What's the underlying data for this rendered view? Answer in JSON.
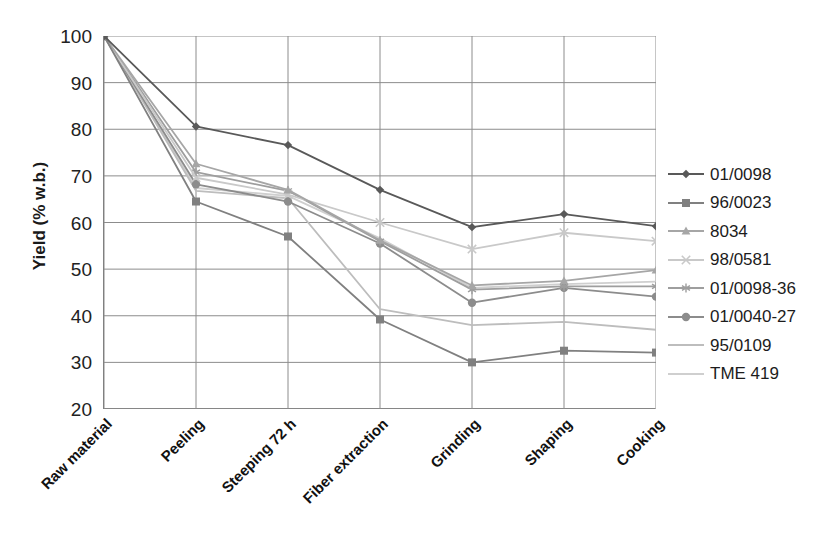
{
  "chart_data": {
    "type": "line",
    "title": "",
    "xlabel": "",
    "ylabel": "Yield (% w.b.)",
    "ylim": [
      20,
      100
    ],
    "yticks": [
      100,
      90,
      80,
      70,
      60,
      50,
      40,
      30,
      20
    ],
    "grid": true,
    "legend_position": "right",
    "categories": [
      "Raw material",
      "Peeling",
      "Steeping 72 h",
      "Fiber extraction",
      "Grinding",
      "Shaping",
      "Cooking"
    ],
    "series": [
      {
        "name": "01/0098",
        "marker": "diamond",
        "color": "#595959",
        "values": [
          100,
          80.6,
          76.6,
          67.0,
          59.0,
          61.8,
          59.2
        ]
      },
      {
        "name": "96/0023",
        "marker": "square",
        "color": "#808080",
        "values": [
          100,
          64.5,
          57.0,
          39.2,
          30.0,
          32.5,
          32.1
        ]
      },
      {
        "name": "8034",
        "marker": "triangle",
        "color": "#a6a6a6",
        "values": [
          100,
          72.6,
          67.0,
          56.2,
          46.5,
          47.5,
          49.8
        ]
      },
      {
        "name": "98/0581",
        "marker": "cross",
        "color": "#c9c9c9",
        "values": [
          100,
          69.6,
          66.0,
          60.0,
          54.3,
          57.8,
          56.0
        ]
      },
      {
        "name": "01/0098-36",
        "marker": "star",
        "color": "#9e9e9e",
        "values": [
          100,
          70.8,
          66.8,
          56.0,
          45.6,
          46.3,
          46.3
        ]
      },
      {
        "name": "01/0040-27",
        "marker": "circle",
        "color": "#8c8c8c",
        "values": [
          100,
          68.2,
          64.5,
          55.5,
          42.8,
          46.0,
          44.1
        ]
      },
      {
        "name": "95/0109",
        "marker": "none",
        "color": "#bdbdbd",
        "values": [
          100,
          66.8,
          65.2,
          41.4,
          38.0,
          38.7,
          37.0
        ]
      },
      {
        "name": "TME 419",
        "marker": "none",
        "color": "#cfcfcf",
        "values": [
          100,
          67.4,
          65.7,
          56.6,
          46.0,
          46.8,
          47.3
        ]
      }
    ]
  },
  "axis": {
    "y_title": "Yield (% w.b.)"
  }
}
